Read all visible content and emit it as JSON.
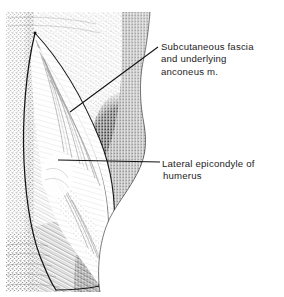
{
  "figure": {
    "type": "anatomical-line-drawing",
    "background_color": "#ffffff",
    "ink_color": "#1c1c1c",
    "technique": "pen-and-ink stipple and hatching"
  },
  "labels": [
    {
      "id": "subcutaneous-fascia",
      "lines": [
        "Subcutaneous fascia",
        "and underlying",
        "anconeus m."
      ],
      "leader": {
        "from_x": 158,
        "from_y": 47,
        "to_x": 70,
        "to_y": 112
      }
    },
    {
      "id": "lateral-epicondyle",
      "lines": [
        "Lateral epicondyle of",
        "humerus"
      ],
      "leader": {
        "from_x": 160,
        "from_y": 162,
        "to_x": 58,
        "to_y": 160
      }
    }
  ]
}
